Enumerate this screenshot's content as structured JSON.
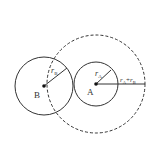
{
  "diagram": {
    "title": "",
    "colors": {
      "stroke": "#333333",
      "background": "#ffffff"
    },
    "circles": [
      {
        "id": "B",
        "label": "B",
        "radius_label": "r",
        "radius_sub": "B",
        "cx": 44,
        "cy": 86,
        "r": 30,
        "style": "solid"
      },
      {
        "id": "A",
        "label": "A",
        "radius_label": "r",
        "radius_sub": "A",
        "cx": 96,
        "cy": 84,
        "r": 22,
        "style": "solid"
      },
      {
        "id": "AB",
        "center": "A",
        "cx": 96,
        "cy": 84,
        "r": 49,
        "style": "dashed"
      }
    ],
    "labels": {
      "B": "B",
      "A": "A",
      "rB_main": "r",
      "rB_sub": "B",
      "rA_main": "r",
      "rA_sub": "A",
      "sum_r1": "r",
      "sum_sub1": "A",
      "sum_plus": "+",
      "sum_r2": "r",
      "sum_sub2": "B"
    }
  }
}
